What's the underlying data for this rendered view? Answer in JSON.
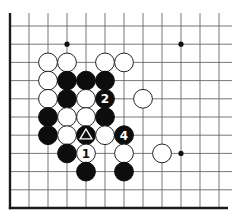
{
  "diagram": {
    "board": {
      "visible_columns": 12,
      "visible_rows": 11,
      "edges": [
        "left",
        "bottom"
      ],
      "star_points": [
        {
          "col": 3,
          "row": 1
        },
        {
          "col": 9,
          "row": 1
        },
        {
          "col": 9,
          "row": 7
        }
      ]
    },
    "colors": {
      "black_stone": "#0d0d0d",
      "white_stone": "#ffffff",
      "grid": "#555555"
    },
    "stones": [
      {
        "color": "white",
        "col": 2,
        "row": 2
      },
      {
        "color": "white",
        "col": 3,
        "row": 2
      },
      {
        "color": "white",
        "col": 5,
        "row": 2
      },
      {
        "color": "white",
        "col": 6,
        "row": 2
      },
      {
        "color": "white",
        "col": 2,
        "row": 3
      },
      {
        "color": "black",
        "col": 3,
        "row": 3
      },
      {
        "color": "black",
        "col": 4,
        "row": 3
      },
      {
        "color": "black",
        "col": 5,
        "row": 3
      },
      {
        "color": "white",
        "col": 2,
        "row": 4
      },
      {
        "color": "black",
        "col": 3,
        "row": 4
      },
      {
        "color": "white",
        "col": 4,
        "row": 4
      },
      {
        "color": "black",
        "col": 5,
        "row": 4,
        "label": "2"
      },
      {
        "color": "white",
        "col": 7,
        "row": 4
      },
      {
        "color": "black",
        "col": 2,
        "row": 5
      },
      {
        "color": "white",
        "col": 3,
        "row": 5
      },
      {
        "color": "white",
        "col": 4,
        "row": 5
      },
      {
        "color": "black",
        "col": 5,
        "row": 5
      },
      {
        "color": "black",
        "col": 2,
        "row": 6
      },
      {
        "color": "white",
        "col": 3,
        "row": 6
      },
      {
        "color": "black",
        "col": 4,
        "row": 6,
        "mark": "triangle"
      },
      {
        "color": "white",
        "col": 5,
        "row": 6
      },
      {
        "color": "black",
        "col": 6,
        "row": 6,
        "label": "4"
      },
      {
        "color": "black",
        "col": 3,
        "row": 7
      },
      {
        "color": "white",
        "col": 4,
        "row": 7,
        "label": "1"
      },
      {
        "color": "white",
        "col": 6,
        "row": 7
      },
      {
        "color": "white",
        "col": 8,
        "row": 7
      },
      {
        "color": "black",
        "col": 4,
        "row": 8
      },
      {
        "color": "black",
        "col": 6,
        "row": 8
      }
    ]
  }
}
